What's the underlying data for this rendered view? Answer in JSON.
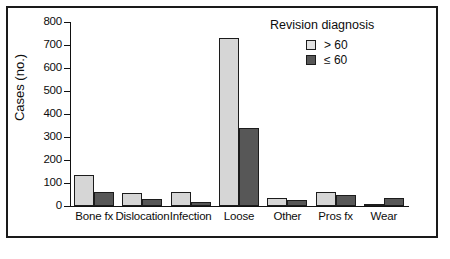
{
  "chart_data": {
    "type": "bar",
    "title": "",
    "xlabel": "",
    "ylabel": "Cases (no.)",
    "ylim": [
      0,
      800
    ],
    "ytick_step": 100,
    "yticks": [
      0,
      100,
      200,
      300,
      400,
      500,
      600,
      700,
      800
    ],
    "ytick_labels": [
      "0",
      "100",
      "200",
      "300",
      "400",
      "500",
      "600",
      "700",
      "800"
    ],
    "grid": false,
    "legend_position": "top-right",
    "legend_title": "Revision diagnosis",
    "categories": [
      "Bone fx",
      "Dislocation",
      "Infection",
      "Loose",
      "Other",
      "Pros fx",
      "Wear"
    ],
    "series": [
      {
        "name": "> 60",
        "color": "#d6d6d6",
        "values": [
          135,
          55,
          62,
          730,
          35,
          62,
          8
        ]
      },
      {
        "name": "≤ 60",
        "color": "#575757",
        "values": [
          60,
          32,
          16,
          340,
          28,
          48,
          35
        ]
      }
    ]
  },
  "axis": {
    "y_title": "Cases (no.)"
  },
  "legend": {
    "title": "Revision diagnosis",
    "entries": [
      {
        "label": "> 60",
        "swatch": "light"
      },
      {
        "label": "≤ 60",
        "swatch": "dark"
      }
    ]
  }
}
